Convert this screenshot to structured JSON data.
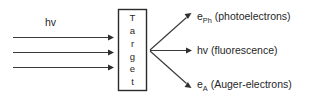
{
  "diagram": {
    "background_color": "#ffffff",
    "line_color": "#3a3a3a",
    "text_color": "#1f1f1f",
    "incoming": {
      "label": "hv",
      "beam_count": 3,
      "description": "incident photon beam"
    },
    "target": {
      "label": "Target",
      "letters": [
        "T",
        "a",
        "r",
        "g",
        "e",
        "t"
      ],
      "orientation": "vertical"
    },
    "outputs": [
      {
        "symbol": "e",
        "subscript": "Ph",
        "name": "(photoelectrons)",
        "full": "ePh (photoelectrons)"
      },
      {
        "symbol": "hv",
        "subscript": "",
        "name": "(fluorescence)",
        "full": "hv (fluorescence)"
      },
      {
        "symbol": "e",
        "subscript": "A",
        "name": "(Auger-electrons)",
        "full": "eA (Auger-electrons)"
      }
    ]
  }
}
